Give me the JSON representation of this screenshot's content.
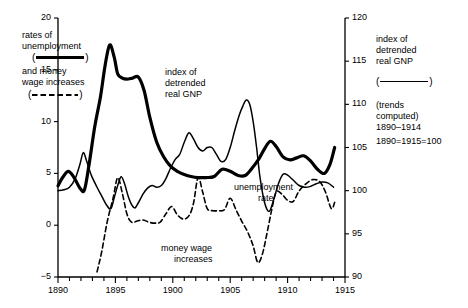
{
  "figure": {
    "background": "#ffffff",
    "ink": "#000000",
    "width": 468,
    "height": 308
  },
  "legend_left": {
    "line1": "rates of",
    "line2": "unemployment",
    "marker_open": "(",
    "marker_close": ")",
    "marker_style": "solid-thick",
    "line3": "and money",
    "line4": "wage increases",
    "marker2_open": "(",
    "marker2_close": ")",
    "marker2_style": "dashed"
  },
  "legend_right": {
    "line1": "index of",
    "line2": "detrended",
    "line3": "real GNP",
    "marker_open": "(",
    "marker_close": ")",
    "marker_style": "solid-thin",
    "note1": "(trends",
    "note2": "computed)",
    "note3": "1890–1914",
    "note4": "1890=1915=100"
  },
  "inline_labels": {
    "gnp": [
      "index of",
      "detrended",
      "real GNP"
    ],
    "unemployment": [
      "unemployment",
      "rate"
    ],
    "wages": [
      "money wage",
      "increases"
    ]
  },
  "chart_data": {
    "type": "line",
    "title": "",
    "subtitle": "",
    "xlabel": "",
    "ylabel": "rates of unemployment and money wage increases",
    "y2label": "index of detrended real GNP",
    "xlim": [
      1890,
      1915
    ],
    "ylim": [
      -5,
      20
    ],
    "y2lim": [
      90,
      120
    ],
    "grid": false,
    "legend_position": "outside-left-and-right",
    "xticks": [
      1890,
      1891,
      1892,
      1893,
      1894,
      1895,
      1896,
      1897,
      1898,
      1899,
      1900,
      1901,
      1902,
      1903,
      1904,
      1905,
      1906,
      1907,
      1908,
      1909,
      1910,
      1911,
      1912,
      1913,
      1914,
      1915
    ],
    "xticklabels": [
      "1890",
      "",
      "",
      "",
      "",
      "1895",
      "",
      "",
      "",
      "",
      "1900",
      "",
      "",
      "",
      "",
      "1905",
      "",
      "",
      "",
      "",
      "1910",
      "",
      "",
      "",
      "",
      "1915"
    ],
    "yticks": [
      -5,
      0,
      5,
      10,
      15,
      20
    ],
    "yticklabels": [
      "−5",
      "0",
      "5",
      "10",
      "15",
      "20"
    ],
    "y2ticks": [
      90,
      95,
      100,
      105,
      110,
      115,
      120
    ],
    "y2ticklabels": [
      "90",
      "95",
      "100",
      "105",
      "110",
      "115",
      "120"
    ],
    "series": [
      {
        "name": "rates of unemployment",
        "axis": "left",
        "style": "solid",
        "width": 3.2,
        "x": [
          1890.0,
          1890.4,
          1890.9,
          1891.4,
          1891.9,
          1892.3,
          1892.7,
          1893.2,
          1893.7,
          1894.1,
          1894.5,
          1894.9,
          1895.2,
          1895.6,
          1896.0,
          1896.5,
          1897.0,
          1897.5,
          1898.0,
          1898.6,
          1899.2,
          1899.8,
          1900.4,
          1901.0,
          1901.6,
          1902.2,
          1902.9,
          1903.6,
          1904.3,
          1905.0,
          1905.7,
          1906.3,
          1906.9,
          1907.5,
          1908.0,
          1908.5,
          1909.0,
          1909.6,
          1910.2,
          1910.8,
          1911.4,
          1912.0,
          1912.6,
          1913.2,
          1913.7,
          1914.1
        ],
        "y": [
          3.8,
          4.6,
          5.2,
          4.6,
          3.6,
          3.4,
          5.8,
          9.5,
          12.4,
          15.4,
          17.4,
          16.2,
          14.6,
          14.2,
          14.1,
          14.2,
          14.3,
          13.0,
          10.4,
          8.0,
          6.6,
          5.7,
          5.2,
          4.9,
          4.7,
          4.6,
          4.6,
          4.7,
          5.4,
          5.2,
          4.8,
          4.8,
          5.5,
          6.4,
          7.4,
          8.1,
          7.6,
          6.6,
          6.3,
          6.5,
          6.7,
          6.2,
          5.4,
          5.0,
          5.9,
          7.5
        ]
      },
      {
        "name": "money wage increases",
        "axis": "left",
        "style": "dashed",
        "width": 1.6,
        "x": [
          1893.4,
          1893.8,
          1894.3,
          1894.8,
          1895.2,
          1895.6,
          1896.0,
          1896.4,
          1896.9,
          1897.4,
          1897.9,
          1898.4,
          1898.9,
          1899.4,
          1899.9,
          1900.4,
          1900.9,
          1901.4,
          1901.8,
          1902.2,
          1902.6,
          1903.0,
          1903.5,
          1904.0,
          1904.5,
          1905.0,
          1905.5,
          1906.0,
          1906.5,
          1907.0,
          1907.4,
          1907.8,
          1908.2,
          1908.6,
          1909.0,
          1909.5,
          1910.0,
          1910.5,
          1911.0,
          1911.6,
          1912.2,
          1912.8,
          1913.3,
          1913.8,
          1914.1
        ],
        "y": [
          -4.5,
          -2.6,
          0.4,
          2.6,
          4.6,
          3.1,
          1.1,
          0.3,
          0.4,
          0.5,
          0.3,
          0.2,
          0.3,
          1.1,
          1.8,
          1.0,
          0.6,
          0.9,
          2.1,
          4.6,
          3.2,
          1.6,
          1.4,
          1.4,
          1.5,
          2.6,
          1.5,
          0.4,
          -0.6,
          -2.0,
          -3.6,
          -2.8,
          -0.8,
          1.4,
          3.2,
          3.0,
          2.4,
          2.3,
          3.3,
          4.0,
          4.4,
          4.2,
          3.2,
          1.6,
          2.2
        ]
      },
      {
        "name": "index of detrended real GNP",
        "axis": "right",
        "style": "solid",
        "width": 1.5,
        "x": [
          1890.0,
          1890.5,
          1891.0,
          1891.5,
          1891.9,
          1892.2,
          1892.5,
          1892.9,
          1893.4,
          1893.8,
          1894.2,
          1894.6,
          1894.9,
          1895.2,
          1895.5,
          1895.8,
          1896.1,
          1896.4,
          1896.7,
          1897.0,
          1897.4,
          1897.8,
          1898.2,
          1898.6,
          1899.0,
          1899.4,
          1899.8,
          1900.2,
          1900.6,
          1901.0,
          1901.4,
          1901.8,
          1902.2,
          1902.6,
          1903.0,
          1903.4,
          1903.8,
          1904.2,
          1904.6,
          1905.0,
          1905.4,
          1905.8,
          1906.1,
          1906.4,
          1906.7,
          1907.0,
          1907.3,
          1907.6,
          1908.0,
          1908.4,
          1908.8,
          1909.2,
          1909.6,
          1910.0,
          1910.5,
          1911.0,
          1911.5,
          1912.0,
          1912.5,
          1913.0,
          1913.5,
          1914.0
        ],
        "y": [
          100.0,
          100.1,
          100.4,
          101.4,
          103.0,
          104.4,
          103.4,
          101.8,
          100.4,
          99.4,
          98.4,
          97.9,
          99.2,
          100.6,
          101.6,
          100.8,
          99.4,
          98.4,
          98.0,
          98.6,
          99.6,
          100.3,
          100.6,
          100.4,
          100.6,
          101.4,
          102.6,
          103.6,
          104.2,
          105.6,
          106.7,
          106.0,
          105.0,
          104.6,
          105.0,
          105.0,
          104.2,
          103.4,
          103.6,
          105.0,
          107.0,
          108.8,
          109.8,
          110.5,
          110.0,
          108.0,
          105.0,
          101.5,
          98.6,
          97.6,
          99.0,
          100.8,
          101.9,
          101.8,
          101.2,
          100.6,
          100.4,
          100.5,
          100.8,
          101.0,
          100.9,
          100.4
        ]
      }
    ]
  }
}
